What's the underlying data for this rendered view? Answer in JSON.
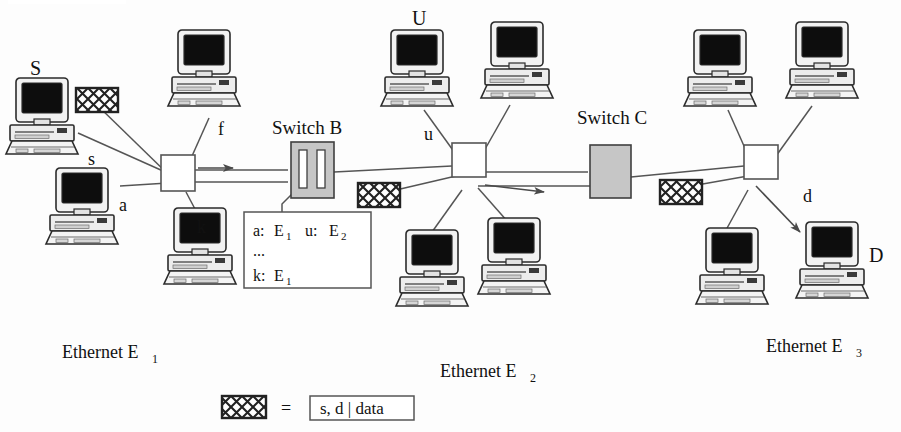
{
  "figure": {
    "type": "network-diagram",
    "background_color": "#fdfdfd",
    "line_color": "#555555",
    "ink_color": "#111111",
    "switch_fill": "#c6c6c6",
    "packet_fill": "#ffffff",
    "packet_stroke": "#222222"
  },
  "labels": {
    "source_host": "S",
    "dest_host": "D",
    "upper_host": "U",
    "switch_b": "Switch B",
    "switch_c": "Switch C",
    "ethernet_1": "Ethernet E",
    "ethernet_1_sub": "1",
    "ethernet_2": "Ethernet E",
    "ethernet_2_sub": "2",
    "ethernet_3": "Ethernet E",
    "ethernet_3_sub": "3",
    "link_s": "s",
    "link_a": "a",
    "link_f": "f",
    "link_k": "k",
    "link_u": "u",
    "link_d": "d"
  },
  "switch_b_table": {
    "rows": [
      {
        "left_key": "a:",
        "left_val": "E",
        "left_sub": "1",
        "right_key": "u:",
        "right_val": "E",
        "right_sub": "2"
      },
      {
        "left_key": "...",
        "left_val": "",
        "left_sub": "",
        "right_key": "",
        "right_val": "",
        "right_sub": ""
      },
      {
        "left_key": "k:",
        "left_val": "E",
        "left_sub": "1",
        "right_key": "",
        "right_val": "",
        "right_sub": ""
      }
    ]
  },
  "legend": {
    "equals": "=",
    "frame_text": "s, d | data"
  },
  "hosts": [
    {
      "id": "host-s",
      "name": "S",
      "x": 10,
      "y": 78,
      "scale": 1.0
    },
    {
      "id": "host-a",
      "name": "a",
      "x": 50,
      "y": 168,
      "scale": 0.92
    },
    {
      "id": "host-f",
      "name": "f",
      "x": 172,
      "y": 30,
      "scale": 1.0
    },
    {
      "id": "host-k",
      "name": "k",
      "x": 168,
      "y": 208,
      "scale": 0.95
    },
    {
      "id": "host-u",
      "name": "U",
      "x": 385,
      "y": 30,
      "scale": 0.95
    },
    {
      "id": "host-u2",
      "name": "",
      "x": 485,
      "y": 22,
      "scale": 0.95
    },
    {
      "id": "host-e2a",
      "name": "",
      "x": 400,
      "y": 230,
      "scale": 0.95
    },
    {
      "id": "host-e2b",
      "name": "",
      "x": 482,
      "y": 218,
      "scale": 0.95
    },
    {
      "id": "host-e3a",
      "name": "",
      "x": 688,
      "y": 30,
      "scale": 0.95
    },
    {
      "id": "host-e3b",
      "name": "",
      "x": 790,
      "y": 22,
      "scale": 0.95
    },
    {
      "id": "host-e3c",
      "name": "",
      "x": 700,
      "y": 228,
      "scale": 0.95
    },
    {
      "id": "host-d",
      "name": "D",
      "x": 800,
      "y": 222,
      "scale": 0.95
    }
  ],
  "packets": [
    {
      "id": "packet-e1",
      "x": 76,
      "y": 88,
      "w": 42,
      "h": 24
    },
    {
      "id": "packet-e2",
      "x": 358,
      "y": 183,
      "w": 42,
      "h": 24
    },
    {
      "id": "packet-e3",
      "x": 660,
      "y": 180,
      "w": 42,
      "h": 24
    },
    {
      "id": "packet-legend",
      "x": 222,
      "y": 396,
      "w": 44,
      "h": 22
    }
  ]
}
